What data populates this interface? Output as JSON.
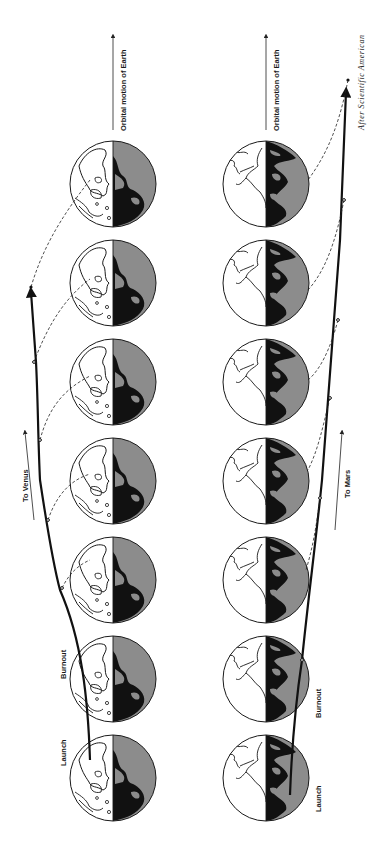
{
  "diagram": {
    "orientation": "rotated 90 degrees counter-clockwise (text reads bottom-to-top)",
    "colors": {
      "background": "#ffffff",
      "land_night": "#111111",
      "ocean_night": "#8c8c8c",
      "outline": "#1a1a1a"
    },
    "panels": [
      {
        "id": "venus",
        "direction_label": "To Venus",
        "motion_label": "Orbital motion of Earth",
        "launch_label": "Launch",
        "burnout_label": "Burnout",
        "globe_count": 7
      },
      {
        "id": "mars",
        "direction_label": "To Mars",
        "motion_label": "Orbital motion of Earth",
        "launch_label": "Launch",
        "burnout_label": "Burnout",
        "globe_count": 7
      }
    ],
    "credit": "After Scientific American"
  }
}
